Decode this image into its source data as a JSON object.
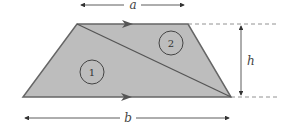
{
  "figure": {
    "shape": "trapezoid",
    "fill_color": "#bdbdbd",
    "stroke_color": "#666666",
    "labels": {
      "top_width": "a",
      "bottom_width": "b",
      "height": "h"
    },
    "regions": [
      {
        "id": "1",
        "label": "1"
      },
      {
        "id": "2",
        "label": "2"
      }
    ]
  }
}
